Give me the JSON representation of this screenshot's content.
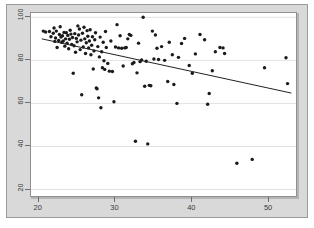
{
  "figure": {
    "kind": "scatter-plot-with-regression-line",
    "background_color": "#d9d9d9",
    "plot_background_color": "#ffffff",
    "point_color": "#1a1a1a",
    "line_color": "#222222",
    "grid_color": "#e2e2e2",
    "axis_color": "#8f8f8f"
  },
  "chart_data": {
    "type": "scatter",
    "title": "",
    "subtitle": "",
    "xlabel": "",
    "ylabel": "",
    "xlim": [
      19,
      53.5
    ],
    "ylim": [
      17,
      102
    ],
    "xticks": [
      20,
      30,
      40,
      50
    ],
    "xtick_labels": [
      "20",
      "30",
      "40",
      "50"
    ],
    "yticks": [
      20,
      40,
      60,
      80,
      100
    ],
    "ytick_labels": [
      "20",
      "40",
      "60",
      "80",
      "100"
    ],
    "grid": true,
    "grid_axis": "y",
    "legend": null,
    "legend_position": "none",
    "annotations": [],
    "series": [
      {
        "name": "observations",
        "marker": "filled-circle",
        "marker_size_px": 3.4,
        "color": "#1a1a1a",
        "points": [
          [
            20.6,
            93.6
          ],
          [
            20.9,
            93.2
          ],
          [
            21.4,
            93.4
          ],
          [
            21.6,
            91.0
          ],
          [
            21.9,
            92.6
          ],
          [
            22.0,
            95.0
          ],
          [
            22.1,
            88.8
          ],
          [
            22.2,
            90.4
          ],
          [
            22.3,
            93.6
          ],
          [
            22.4,
            86.0
          ],
          [
            22.6,
            89.2
          ],
          [
            22.7,
            92.0
          ],
          [
            22.8,
            95.6
          ],
          [
            22.9,
            90.8
          ],
          [
            23.0,
            88.4
          ],
          [
            23.1,
            91.4
          ],
          [
            23.2,
            89.0
          ],
          [
            23.3,
            93.0
          ],
          [
            23.4,
            86.6
          ],
          [
            23.5,
            90.0
          ],
          [
            23.6,
            92.8
          ],
          [
            23.7,
            88.0
          ],
          [
            23.8,
            91.6
          ],
          [
            23.9,
            85.4
          ],
          [
            24.0,
            89.8
          ],
          [
            24.1,
            94.0
          ],
          [
            24.2,
            92.2
          ],
          [
            24.3,
            87.4
          ],
          [
            24.4,
            90.6
          ],
          [
            24.5,
            74.0
          ],
          [
            24.6,
            86.8
          ],
          [
            24.7,
            92.4
          ],
          [
            24.8,
            83.8
          ],
          [
            24.9,
            90.2
          ],
          [
            25.0,
            88.6
          ],
          [
            25.1,
            96.0
          ],
          [
            25.2,
            91.8
          ],
          [
            25.3,
            94.6
          ],
          [
            25.4,
            85.0
          ],
          [
            25.5,
            89.4
          ],
          [
            25.6,
            64.0
          ],
          [
            25.7,
            92.6
          ],
          [
            25.8,
            86.2
          ],
          [
            25.9,
            95.4
          ],
          [
            26.0,
            90.0
          ],
          [
            26.1,
            83.2
          ],
          [
            26.2,
            88.2
          ],
          [
            26.3,
            93.8
          ],
          [
            26.4,
            91.2
          ],
          [
            26.5,
            85.8
          ],
          [
            26.6,
            89.0
          ],
          [
            26.7,
            94.2
          ],
          [
            26.8,
            82.6
          ],
          [
            26.9,
            87.0
          ],
          [
            27.0,
            91.0
          ],
          [
            27.1,
            76.0
          ],
          [
            27.2,
            84.4
          ],
          [
            27.3,
            89.6
          ],
          [
            27.4,
            92.8
          ],
          [
            27.5,
            67.2
          ],
          [
            27.6,
            66.8
          ],
          [
            27.7,
            86.4
          ],
          [
            27.8,
            62.6
          ],
          [
            27.9,
            81.6
          ],
          [
            28.0,
            90.8
          ],
          [
            28.1,
            58.0
          ],
          [
            28.2,
            84.0
          ],
          [
            28.3,
            76.6
          ],
          [
            28.4,
            88.4
          ],
          [
            28.5,
            79.8
          ],
          [
            28.6,
            75.8
          ],
          [
            28.7,
            93.4
          ],
          [
            28.8,
            86.0
          ],
          [
            29.0,
            78.6
          ],
          [
            29.2,
            75.0
          ],
          [
            29.4,
            89.0
          ],
          [
            29.6,
            74.8
          ],
          [
            29.8,
            60.8
          ],
          [
            30.0,
            86.2
          ],
          [
            30.2,
            96.6
          ],
          [
            30.4,
            85.8
          ],
          [
            30.6,
            91.4
          ],
          [
            30.8,
            85.6
          ],
          [
            31.0,
            77.4
          ],
          [
            31.2,
            85.8
          ],
          [
            31.4,
            86.0
          ],
          [
            31.6,
            90.0
          ],
          [
            31.8,
            92.0
          ],
          [
            32.0,
            91.6
          ],
          [
            32.2,
            78.4
          ],
          [
            32.4,
            79.0
          ],
          [
            32.6,
            42.4
          ],
          [
            32.8,
            74.2
          ],
          [
            33.0,
            88.0
          ],
          [
            33.2,
            79.4
          ],
          [
            33.4,
            80.2
          ],
          [
            33.6,
            100.0
          ],
          [
            33.8,
            68.0
          ],
          [
            34.0,
            79.6
          ],
          [
            34.2,
            41.2
          ],
          [
            34.4,
            68.4
          ],
          [
            34.6,
            68.2
          ],
          [
            34.8,
            93.6
          ],
          [
            35.0,
            80.6
          ],
          [
            35.2,
            91.8
          ],
          [
            35.4,
            85.6
          ],
          [
            35.6,
            80.4
          ],
          [
            36.0,
            86.4
          ],
          [
            36.4,
            80.0
          ],
          [
            36.8,
            70.2
          ],
          [
            37.0,
            88.4
          ],
          [
            37.4,
            82.6
          ],
          [
            37.6,
            68.8
          ],
          [
            38.0,
            60.0
          ],
          [
            38.2,
            81.4
          ],
          [
            38.6,
            87.8
          ],
          [
            39.0,
            90.2
          ],
          [
            39.6,
            77.6
          ],
          [
            40.0,
            74.0
          ],
          [
            40.4,
            83.0
          ],
          [
            41.0,
            92.0
          ],
          [
            41.6,
            89.6
          ],
          [
            42.0,
            59.6
          ],
          [
            42.2,
            64.6
          ],
          [
            42.6,
            75.2
          ],
          [
            43.0,
            84.0
          ],
          [
            43.6,
            86.0
          ],
          [
            44.0,
            85.8
          ],
          [
            44.2,
            83.2
          ],
          [
            45.8,
            32.2
          ],
          [
            47.8,
            34.0
          ],
          [
            49.4,
            76.6
          ],
          [
            52.2,
            81.2
          ],
          [
            52.4,
            69.2
          ]
        ]
      }
    ],
    "fit_line": {
      "name": "least-squares-fit",
      "color": "#222222",
      "width_px": 1,
      "x_start": 20.4,
      "y_start": 90.0,
      "x_end": 52.9,
      "y_end": 64.8,
      "slope": -0.775,
      "intercept": 105.8
    }
  },
  "axes": {
    "x_tick_labels": [
      "20",
      "30",
      "40",
      "50"
    ],
    "y_tick_labels": [
      "20",
      "40",
      "60",
      "80",
      "100"
    ]
  }
}
